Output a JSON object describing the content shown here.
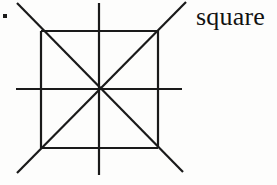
{
  "page": {
    "background_color": "#fdfdfc",
    "ink_color": "#1a1a1a",
    "width": 277,
    "height": 185
  },
  "item_marker": {
    "name": "list-item-period",
    "glyph": ".",
    "x": 3,
    "y": 14,
    "color": "#1a1a1a"
  },
  "label": {
    "text": "square",
    "x": 196,
    "y": 2,
    "font_size_px": 26,
    "color": "#121212"
  },
  "figure": {
    "name": "square-with-diagonals-and-medians",
    "stroke_color": "#1a1a1a",
    "stroke_width": 2.2,
    "center": {
      "x": 99,
      "y": 89
    },
    "square": {
      "left": 41,
      "top": 31,
      "right": 158,
      "bottom": 148
    },
    "lines": [
      {
        "name": "square-edge-top",
        "x1": 41,
        "y1": 31,
        "x2": 158,
        "y2": 31
      },
      {
        "name": "square-edge-right",
        "x1": 158,
        "y1": 31,
        "x2": 158,
        "y2": 148
      },
      {
        "name": "square-edge-bottom",
        "x1": 158,
        "y1": 148,
        "x2": 41,
        "y2": 148
      },
      {
        "name": "square-edge-left",
        "x1": 41,
        "y1": 148,
        "x2": 41,
        "y2": 31
      },
      {
        "name": "diagonal-tl-br-extended",
        "x1": 17,
        "y1": 3,
        "x2": 183,
        "y2": 172
      },
      {
        "name": "diagonal-bl-tr-extended",
        "x1": 17,
        "y1": 173,
        "x2": 186,
        "y2": 2
      },
      {
        "name": "median-vertical-extended",
        "x1": 99,
        "y1": 3,
        "x2": 99,
        "y2": 175
      },
      {
        "name": "median-horizontal-extended",
        "x1": 16,
        "y1": 89,
        "x2": 182,
        "y2": 89
      }
    ]
  }
}
